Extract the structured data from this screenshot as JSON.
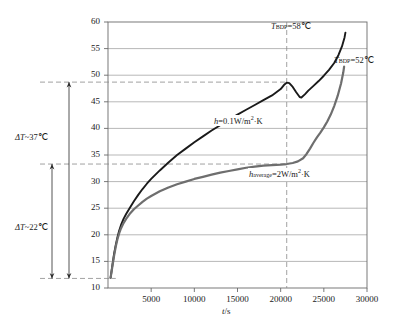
{
  "chart_data": {
    "type": "line",
    "title": "",
    "xlabel": "t/s",
    "ylabel": "",
    "xlim": [
      0,
      30000
    ],
    "ylim": [
      10,
      60
    ],
    "grid": true,
    "legend_position": "inline-annotations",
    "xticks": [
      5000,
      10000,
      15000,
      20000,
      25000,
      30000
    ],
    "xtick_labels": [
      "5000",
      "10000",
      "15000",
      "20000",
      "25000",
      "30000"
    ],
    "yticks": [
      10,
      15,
      20,
      25,
      30,
      35,
      40,
      45,
      50,
      55,
      60
    ],
    "ytick_labels": [
      "10",
      "15",
      "20",
      "25",
      "30",
      "35",
      "40",
      "45",
      "50",
      "55",
      "60"
    ],
    "series": [
      {
        "name": "h=0.1W/m2·K",
        "color": "#1a1a1a",
        "points": [
          [
            300,
            11.9
          ],
          [
            500,
            14.2
          ],
          [
            700,
            16.4
          ],
          [
            900,
            18.1
          ],
          [
            1100,
            19.6
          ],
          [
            1300,
            20.8
          ],
          [
            1500,
            21.8
          ],
          [
            1800,
            23.0
          ],
          [
            2100,
            23.9
          ],
          [
            2500,
            25.0
          ],
          [
            3000,
            26.3
          ],
          [
            3500,
            27.5
          ],
          [
            4000,
            28.6
          ],
          [
            4500,
            29.6
          ],
          [
            5000,
            30.5
          ],
          [
            6000,
            32.1
          ],
          [
            7000,
            33.6
          ],
          [
            8000,
            35.0
          ],
          [
            9000,
            36.2
          ],
          [
            10000,
            37.4
          ],
          [
            11000,
            38.5
          ],
          [
            12000,
            39.6
          ],
          [
            13000,
            40.6
          ],
          [
            14000,
            41.6
          ],
          [
            15000,
            42.6
          ],
          [
            16000,
            43.5
          ],
          [
            17000,
            44.4
          ],
          [
            18000,
            45.3
          ],
          [
            19000,
            46.2
          ],
          [
            20000,
            47.4
          ],
          [
            20400,
            48.2
          ],
          [
            20700,
            48.6
          ],
          [
            21000,
            48.5
          ],
          [
            21400,
            47.8
          ],
          [
            21800,
            46.8
          ],
          [
            22200,
            45.9
          ],
          [
            22400,
            45.8
          ],
          [
            22800,
            46.4
          ],
          [
            23200,
            47.1
          ],
          [
            23800,
            48.0
          ],
          [
            24400,
            48.9
          ],
          [
            25000,
            49.9
          ],
          [
            25600,
            51.0
          ],
          [
            26200,
            52.3
          ],
          [
            26700,
            53.8
          ],
          [
            27100,
            55.4
          ],
          [
            27400,
            57.1
          ],
          [
            27500,
            58.0
          ]
        ]
      },
      {
        "name": "h_average=2W/m2·K",
        "color": "#6e6e6e",
        "points": [
          [
            300,
            11.9
          ],
          [
            500,
            14.0
          ],
          [
            700,
            16.0
          ],
          [
            900,
            17.8
          ],
          [
            1100,
            19.2
          ],
          [
            1300,
            20.3
          ],
          [
            1500,
            21.2
          ],
          [
            1800,
            22.2
          ],
          [
            2100,
            23.0
          ],
          [
            2500,
            23.9
          ],
          [
            3000,
            24.8
          ],
          [
            3500,
            25.5
          ],
          [
            4000,
            26.2
          ],
          [
            4500,
            26.8
          ],
          [
            5000,
            27.3
          ],
          [
            6000,
            28.2
          ],
          [
            7000,
            28.9
          ],
          [
            8000,
            29.5
          ],
          [
            9000,
            30.0
          ],
          [
            10000,
            30.5
          ],
          [
            11000,
            30.9
          ],
          [
            12000,
            31.3
          ],
          [
            13000,
            31.7
          ],
          [
            14000,
            32.0
          ],
          [
            15000,
            32.3
          ],
          [
            16000,
            32.6
          ],
          [
            17000,
            32.8
          ],
          [
            18000,
            33.0
          ],
          [
            19000,
            33.1
          ],
          [
            20000,
            33.2
          ],
          [
            20700,
            33.3
          ],
          [
            21400,
            33.5
          ],
          [
            22000,
            33.8
          ],
          [
            22600,
            34.4
          ],
          [
            23000,
            35.2
          ],
          [
            23400,
            36.2
          ],
          [
            23800,
            37.3
          ],
          [
            24200,
            38.3
          ],
          [
            24600,
            39.2
          ],
          [
            25000,
            40.2
          ],
          [
            25400,
            41.3
          ],
          [
            25800,
            42.6
          ],
          [
            26200,
            44.2
          ],
          [
            26600,
            46.1
          ],
          [
            27000,
            48.5
          ],
          [
            27250,
            50.5
          ],
          [
            27350,
            51.6
          ]
        ]
      }
    ],
    "annotations": [
      {
        "id": "tbdp58",
        "text": "T_BDP=58℃",
        "x": 21000,
        "y": 58.2
      },
      {
        "id": "tbdp52",
        "text": "T_BDP=52℃",
        "x": 27700,
        "y": 52.6
      },
      {
        "id": "h01",
        "text": "h=0.1W/m2·K",
        "x": 14000,
        "y": 41.5
      },
      {
        "id": "havg",
        "text": "h_average=2W/m2·K",
        "x": 20800,
        "y": 31.5
      },
      {
        "id": "dt37",
        "text": "ΔT~37℃",
        "value": 37,
        "span_from": 11.8,
        "span_to": 48.7
      },
      {
        "id": "dt22",
        "text": "ΔT~22℃",
        "value": 22,
        "span_from": 11.8,
        "span_to": 33.3
      }
    ],
    "guides": {
      "vertical_dashed_x": 20700,
      "horizontal_dashed_y": [
        48.7,
        33.3
      ]
    }
  },
  "labels": {
    "tbdp58_base": "T",
    "tbdp58_sub": "BDP",
    "tbdp58_rest": "=58℃",
    "tbdp52_base": "T",
    "tbdp52_sub": "BDP",
    "tbdp52_rest": "=52℃",
    "h01_base": "h",
    "h01_mid": "=0.1W/m",
    "h01_sup": "2",
    "h01_rest": "·K",
    "havg_base": "h",
    "havg_sub": "average",
    "havg_mid": "=2W/m",
    "havg_sup": "2",
    "havg_rest": "·K",
    "dt37_delta": "ΔT",
    "dt37_rest": "~37℃",
    "dt22_delta": "ΔT",
    "dt22_rest": "~22℃",
    "xaxis_ital": "t",
    "xaxis_rest": "/s"
  },
  "colors": {
    "curve_black": "#1a1a1a",
    "curve_gray": "#6e6e6e",
    "grid": "#9a9a9a",
    "frame": "#6a6a6a",
    "dashed": "#8a8a8a",
    "text": "#2a2a2a",
    "background": "#ffffff"
  }
}
